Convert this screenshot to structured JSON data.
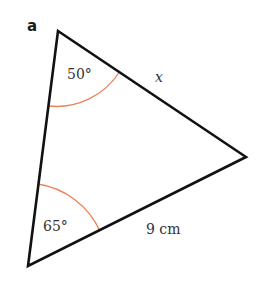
{
  "figure": {
    "part_label": "a",
    "vertices": {
      "top": [
        58,
        31
      ],
      "right": [
        246,
        157
      ],
      "bottom": [
        28,
        266
      ]
    },
    "angles": {
      "top": {
        "label": "50°"
      },
      "bottom": {
        "label": "65°"
      }
    },
    "sides": {
      "top_right": {
        "label": "x"
      },
      "bottom_right": {
        "label": "9 cm"
      }
    },
    "colors": {
      "stroke": "#111111",
      "arc": "#E8825A",
      "text": "#333333"
    }
  }
}
